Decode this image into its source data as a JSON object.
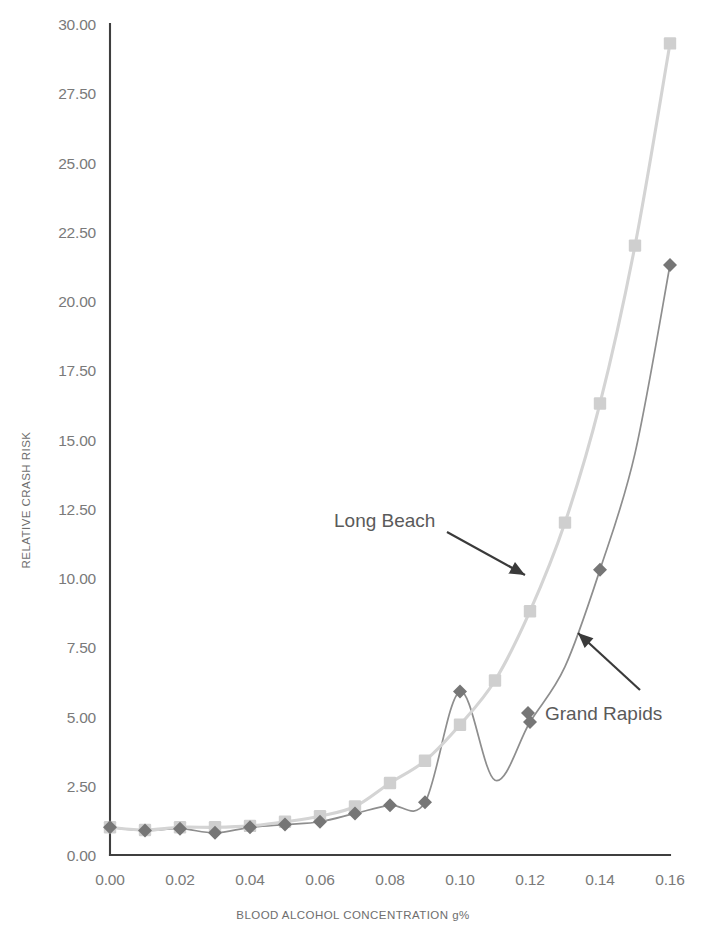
{
  "chart_data": {
    "type": "line",
    "title": "",
    "xlabel": "BLOOD ALCOHOL CONCENTRATION g%",
    "ylabel": "RELATIVE CRASH RISK",
    "xlim": [
      0.0,
      0.16
    ],
    "ylim": [
      0.0,
      30.0
    ],
    "xticks": [
      "0.00",
      "0.02",
      "0.04",
      "0.06",
      "0.08",
      "0.10",
      "0.12",
      "0.14",
      "0.16"
    ],
    "xtick_values": [
      0.0,
      0.02,
      0.04,
      0.06,
      0.08,
      0.1,
      0.12,
      0.14,
      0.16
    ],
    "yticks": [
      "0.00",
      "2.50",
      "5.00",
      "7.50",
      "10.00",
      "12.50",
      "15.00",
      "17.50",
      "20.00",
      "22.50",
      "25.00",
      "27.50",
      "30.00"
    ],
    "ytick_values": [
      0.0,
      2.5,
      5.0,
      7.5,
      10.0,
      12.5,
      15.0,
      17.5,
      20.0,
      22.5,
      25.0,
      27.5,
      30.0
    ],
    "grid": false,
    "legend_position": "none",
    "annotations": [
      {
        "text": "Long Beach",
        "label_x": 0.0755,
        "label_y": 12.55,
        "point_x": 0.1115,
        "point_y": 10.35
      },
      {
        "text": "Grand Rapids",
        "label_x": 0.1245,
        "label_y": 5.15,
        "point_x": 0.1135,
        "point_y": 7.45
      }
    ],
    "series": [
      {
        "name": "Long Beach",
        "marker": "square",
        "color": "#cfcfcf",
        "line_color": "#d4d4d4",
        "x": [
          0.0,
          0.01,
          0.02,
          0.03,
          0.04,
          0.05,
          0.06,
          0.07,
          0.08,
          0.09,
          0.1,
          0.11,
          0.12,
          0.13,
          0.14,
          0.15,
          0.16
        ],
        "values": [
          1.0,
          0.9,
          1.0,
          1.0,
          1.05,
          1.2,
          1.4,
          1.75,
          2.6,
          3.4,
          4.7,
          6.3,
          8.8,
          12.0,
          16.3,
          22.0,
          29.3
        ]
      },
      {
        "name": "Grand Rapids",
        "marker": "diamond",
        "color": "#767676",
        "line_color": "#8e8e8e",
        "x": [
          0.0,
          0.01,
          0.02,
          0.03,
          0.04,
          0.05,
          0.06,
          0.07,
          0.08,
          0.09,
          0.1,
          0.11,
          0.12,
          0.13,
          0.14,
          0.15,
          0.16
        ],
        "values": [
          1.0,
          0.88,
          0.95,
          0.8,
          1.0,
          1.1,
          1.2,
          1.5,
          1.8,
          1.9,
          5.9,
          2.7,
          4.8,
          6.8,
          10.3,
          14.5,
          21.3
        ],
        "marker_x": [
          0.0,
          0.01,
          0.02,
          0.03,
          0.04,
          0.05,
          0.06,
          0.07,
          0.08,
          0.09,
          0.1,
          0.12,
          0.14,
          0.16
        ],
        "marker_values": [
          1.0,
          0.88,
          0.95,
          0.8,
          1.0,
          1.1,
          1.2,
          1.5,
          1.8,
          1.9,
          5.9,
          4.8,
          10.3,
          21.3
        ]
      }
    ]
  },
  "colors": {
    "long_beach": "#cfcfcf",
    "grand_rapids": "#767676",
    "axis": "#3f3f3f",
    "tick_text": "#7a7a7a",
    "annotation_text": "#5a5a5a",
    "background": "#ffffff"
  }
}
